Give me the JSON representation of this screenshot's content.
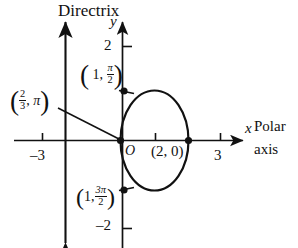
{
  "figure": {
    "title_label": "Directrix",
    "axes": {
      "x_axis_symbol": "x",
      "y_axis_symbol": "y",
      "x_axis_name_line1": "Polar",
      "x_axis_name_line2": "axis",
      "origin_label": "O",
      "x_ticks": [
        {
          "value": -3,
          "label": "–3"
        },
        {
          "value": 3,
          "label": "3"
        }
      ],
      "y_ticks": [
        {
          "value": 2,
          "label": "2"
        },
        {
          "value": -2,
          "label": "–2"
        }
      ],
      "x_range": [
        -3.8,
        3.6
      ],
      "y_range": [
        -2.3,
        2.4
      ],
      "grid": false
    },
    "points": [
      {
        "name": "right-vertex",
        "label_text": "(2, 0)",
        "r": 2,
        "theta": "0",
        "x": 2,
        "y": 0
      },
      {
        "name": "top-point",
        "label_open_paren": "(",
        "label_r": "1,",
        "label_num": "π",
        "label_den": "2",
        "label_close_paren": ")",
        "r": 1,
        "theta": "pi/2",
        "x": 0,
        "y": 1
      },
      {
        "name": "bottom-point",
        "label_open_paren": "(",
        "label_r": "1,",
        "label_num": "3π",
        "label_den": "2",
        "label_close_paren": ")",
        "r": 1,
        "theta": "3pi/2",
        "x": 0,
        "y": -1
      },
      {
        "name": "left-vertex",
        "label_open_paren": "(",
        "label_num": "2",
        "label_den": "3",
        "label_comma": ",",
        "label_theta": "π",
        "label_close_paren": ")",
        "r": 0.667,
        "theta": "pi",
        "x": 0,
        "y": 0
      }
    ],
    "curve": {
      "type": "ellipse",
      "description": "conic with focus at origin, directrix vertical line at left",
      "center_x": 1,
      "center_y": 0,
      "semi_axis_x": 1,
      "semi_axis_y": 1.45,
      "stroke": "#111111"
    },
    "directrix": {
      "label": "Directrix",
      "x_value": -1.72,
      "stroke": "#111111"
    },
    "colors": {
      "ink": "#111111",
      "background": "#ffffff"
    }
  }
}
